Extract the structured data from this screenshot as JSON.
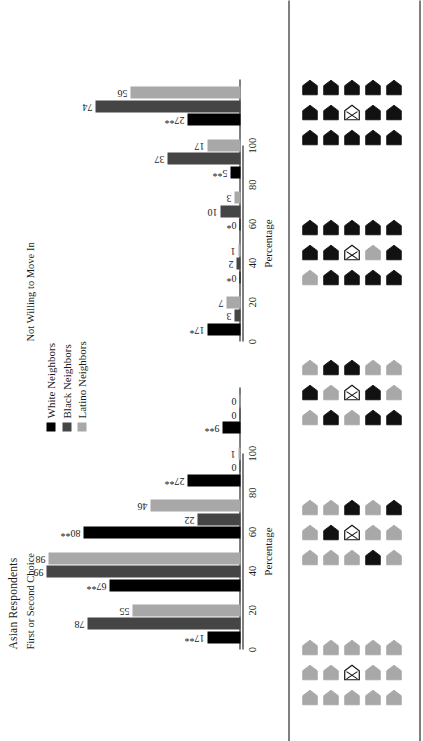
{
  "figure": {
    "title": "Asian Respondents",
    "axis_caption": "Percentage"
  },
  "legend": {
    "position": "top-center",
    "items": [
      {
        "label": "White Neighbors",
        "color": "#000000"
      },
      {
        "label": "Black Neighbors",
        "color": "#454545"
      },
      {
        "label": "Latino Neighbors",
        "color": "#a8a8a8"
      }
    ]
  },
  "panels": [
    {
      "title": "First or Second Choice"
    },
    {
      "title": "Not Willing to Move In"
    }
  ],
  "axis": {
    "ticks": [
      "0",
      "20",
      "40",
      "60",
      "80",
      "100"
    ],
    "values": [
      0,
      20,
      40,
      60,
      80,
      100
    ],
    "min": 0,
    "max": 100
  },
  "diagrams": [
    {
      "name": "neighborhood-1",
      "own_house": "X",
      "shades": [
        [
          "L",
          "L",
          "L"
        ],
        [
          "L",
          "L",
          "L"
        ],
        [
          "L",
          "X",
          "L"
        ],
        [
          "L",
          "L",
          "L"
        ],
        [
          "L",
          "L",
          "L"
        ]
      ]
    },
    {
      "name": "neighborhood-2",
      "own_house": "X",
      "shades": [
        [
          "L",
          "L",
          "L"
        ],
        [
          "L",
          "D",
          "L"
        ],
        [
          "L",
          "X",
          "D"
        ],
        [
          "D",
          "L",
          "L"
        ],
        [
          "L",
          "L",
          "D"
        ]
      ]
    },
    {
      "name": "neighborhood-3",
      "own_house": "X",
      "shades": [
        [
          "L",
          "D",
          "L"
        ],
        [
          "D",
          "L",
          "D"
        ],
        [
          "L",
          "X",
          "D"
        ],
        [
          "D",
          "D",
          "L"
        ],
        [
          "D",
          "L",
          "L"
        ]
      ]
    },
    {
      "name": "neighborhood-4",
      "own_house": "X",
      "shades": [
        [
          "L",
          "D",
          "D"
        ],
        [
          "D",
          "D",
          "D"
        ],
        [
          "D",
          "X",
          "D"
        ],
        [
          "D",
          "L",
          "D"
        ],
        [
          "D",
          "D",
          "D"
        ]
      ]
    },
    {
      "name": "neighborhood-5",
      "own_house": "X",
      "shades": [
        [
          "D",
          "D",
          "D"
        ],
        [
          "D",
          "D",
          "D"
        ],
        [
          "D",
          "X",
          "D"
        ],
        [
          "D",
          "D",
          "D"
        ],
        [
          "D",
          "D",
          "D"
        ]
      ]
    }
  ],
  "chart_data": {
    "type": "bar",
    "title": "Asian Respondents",
    "xlabel": "Percentage",
    "ylabel": "",
    "xlim": [
      0,
      100
    ],
    "grid": false,
    "legend_position": "top-center",
    "categories": [
      "Neighborhood 1",
      "Neighborhood 2",
      "Neighborhood 3",
      "Neighborhood 4",
      "Neighborhood 5"
    ],
    "panels": [
      {
        "title": "First or Second Choice",
        "series": [
          {
            "name": "White Neighbors",
            "color": "#000000",
            "values": [
              17,
              67,
              80,
              27,
              9
            ],
            "labels": [
              "17**",
              "67**",
              "80**",
              "27**",
              "9**"
            ]
          },
          {
            "name": "Black Neighbors",
            "color": "#454545",
            "values": [
              78,
              99,
              22,
              0,
              0
            ],
            "labels": [
              "78",
              "99",
              "22",
              "0",
              "0"
            ]
          },
          {
            "name": "Latino Neighbors",
            "color": "#a8a8a8",
            "values": [
              55,
              98,
              46,
              1,
              0
            ],
            "labels": [
              "55",
              "98",
              "46",
              "1",
              "0"
            ]
          }
        ]
      },
      {
        "title": "Not Willing to Move In",
        "series": [
          {
            "name": "White Neighbors",
            "color": "#000000",
            "values": [
              17,
              0,
              0,
              5,
              27
            ],
            "labels": [
              "17*",
              "0*",
              "0*",
              "5**",
              "27**"
            ]
          },
          {
            "name": "Black Neighbors",
            "color": "#454545",
            "values": [
              3,
              2,
              10,
              37,
              74
            ],
            "labels": [
              "3",
              "2",
              "10",
              "37",
              "74"
            ]
          },
          {
            "name": "Latino Neighbors",
            "color": "#a8a8a8",
            "values": [
              7,
              1,
              3,
              17,
              56
            ],
            "labels": [
              "7",
              "1",
              "3",
              "17",
              "56"
            ]
          }
        ]
      }
    ]
  }
}
